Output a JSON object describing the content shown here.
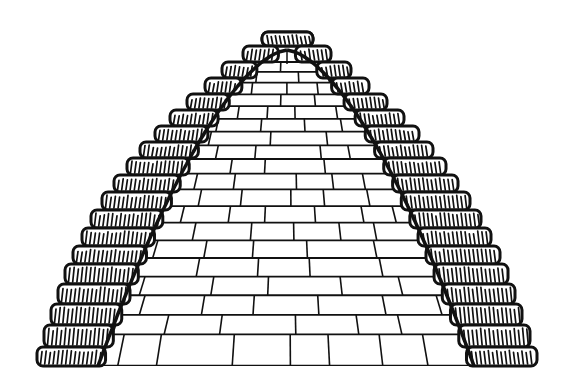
{
  "figure": {
    "colors": {
      "ink": "#111111",
      "background": "#ffffff",
      "block_fill": "#ffffff"
    },
    "apex": [
      287,
      50
    ],
    "base_y": 366,
    "inner_base_left_x": 98,
    "inner_base_right_x": 474,
    "tiers": [
      {
        "y": 32,
        "lx": 262,
        "rx": 313
      },
      {
        "y": 46,
        "lx": 243,
        "rx": 331
      },
      {
        "y": 62,
        "lx": 222,
        "rx": 351
      },
      {
        "y": 78,
        "lx": 205,
        "rx": 369
      },
      {
        "y": 94,
        "lx": 187,
        "rx": 387
      },
      {
        "y": 110,
        "lx": 170,
        "rx": 404
      },
      {
        "y": 126,
        "lx": 155,
        "rx": 419
      },
      {
        "y": 142,
        "lx": 140,
        "rx": 433
      },
      {
        "y": 158,
        "lx": 127,
        "rx": 446
      },
      {
        "y": 175,
        "lx": 114,
        "rx": 458
      },
      {
        "y": 192,
        "lx": 102,
        "rx": 470
      },
      {
        "y": 210,
        "lx": 91,
        "rx": 481
      },
      {
        "y": 228,
        "lx": 82,
        "rx": 491
      },
      {
        "y": 246,
        "lx": 73,
        "rx": 500
      },
      {
        "y": 264,
        "lx": 65,
        "rx": 508
      },
      {
        "y": 284,
        "lx": 58,
        "rx": 515
      },
      {
        "y": 304,
        "lx": 51,
        "rx": 522
      },
      {
        "y": 325,
        "lx": 44,
        "rx": 530
      },
      {
        "y": 347,
        "lx": 37,
        "rx": 537
      }
    ],
    "course_count": 19
  }
}
